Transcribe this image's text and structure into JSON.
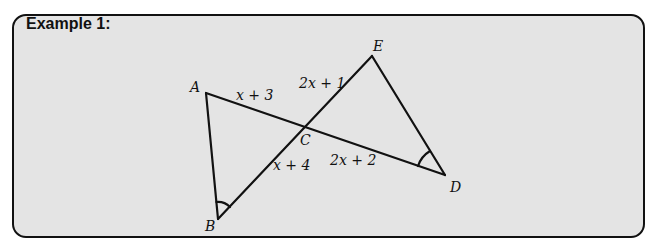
{
  "title": "Example 1:",
  "diagram": {
    "vertices": [
      {
        "name": "A",
        "x": 206,
        "y": 93,
        "lx": 190,
        "ly": 92
      },
      {
        "name": "B",
        "x": 218,
        "y": 219,
        "lx": 205,
        "ly": 231
      },
      {
        "name": "C",
        "x": 307,
        "y": 125,
        "lx": 300,
        "ly": 145
      },
      {
        "name": "D",
        "x": 445,
        "y": 175,
        "lx": 450,
        "ly": 192
      },
      {
        "name": "E",
        "x": 372,
        "y": 56,
        "lx": 373,
        "ly": 51
      }
    ],
    "segments": [
      {
        "from": "A",
        "to": "D"
      },
      {
        "from": "A",
        "to": "B"
      },
      {
        "from": "B",
        "to": "E"
      },
      {
        "from": "E",
        "to": "D"
      }
    ],
    "edge_labels": [
      {
        "text": "x + 3",
        "x": 236,
        "y": 100
      },
      {
        "text": "2x + 1",
        "x": 299,
        "y": 88
      },
      {
        "text": "x + 4",
        "x": 273,
        "y": 170
      },
      {
        "text": "2x + 2",
        "x": 330,
        "y": 165
      }
    ],
    "angle_marks": [
      "B",
      "D"
    ],
    "colors": {
      "line": "#111111",
      "box": "#e4e4e4"
    }
  }
}
